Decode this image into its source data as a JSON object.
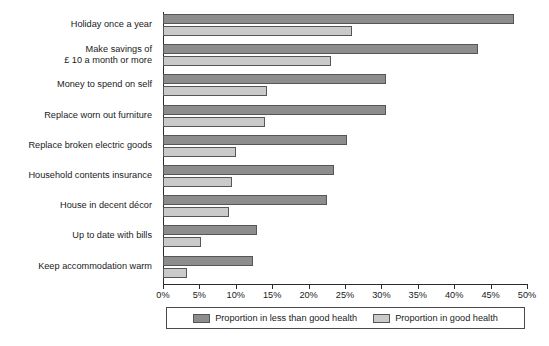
{
  "chart_data": {
    "type": "bar",
    "orientation": "horizontal",
    "title": "",
    "subtitle": "",
    "xlabel": "",
    "ylabel": "",
    "xlim": [
      0,
      50
    ],
    "xunit": "%",
    "grid": false,
    "legend_position": "bottom",
    "categories": [
      "Holiday once a year",
      "Make savings of\n£ 10 a month or more",
      "Money to spend on self",
      "Replace worn out furniture",
      "Replace broken electric goods",
      "Household contents insurance",
      "House in decent décor",
      "Up to date with bills",
      "Keep accommodation warm"
    ],
    "series": [
      {
        "name": "Proportion in less than good health",
        "color": "#8d8d8d",
        "values": [
          48.2,
          43.3,
          30.6,
          30.6,
          25.3,
          23.5,
          22.5,
          12.9,
          12.4
        ]
      },
      {
        "name": "Proportion in good health",
        "color": "#cacaca",
        "values": [
          26.0,
          23.1,
          14.3,
          14.0,
          10.0,
          9.5,
          9.1,
          5.2,
          3.3
        ]
      }
    ],
    "tick_labels": [
      "0%",
      "5%",
      "10%",
      "15%",
      "20%",
      "25%",
      "30%",
      "35%",
      "40%",
      "45%",
      "50%"
    ],
    "tick_values": [
      0,
      5,
      10,
      15,
      20,
      25,
      30,
      35,
      40,
      45,
      50
    ]
  },
  "legend": {
    "items": [
      {
        "label": "Proportion in less than good health",
        "swatch": "dark"
      },
      {
        "label": "Proportion in good health",
        "swatch": "light"
      }
    ]
  }
}
